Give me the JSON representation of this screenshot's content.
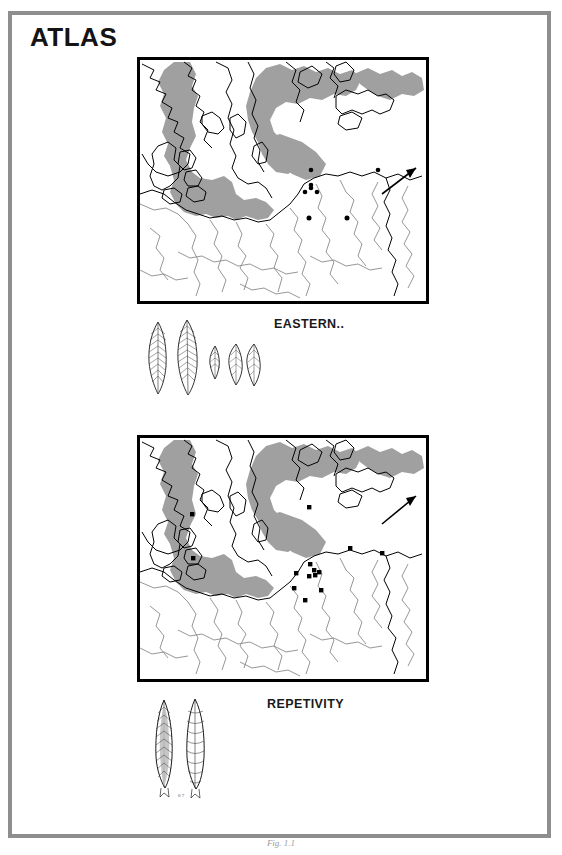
{
  "page": {
    "title": "ATLAS",
    "caption": "Fig. 1.1",
    "frame_color": "#8e8e8e",
    "background": "#ffffff"
  },
  "colors": {
    "sea_fill": "#a0a0a0",
    "land_fill": "#ffffff",
    "coastline": "#000000",
    "river": "#8a8a8a",
    "site_dot": "#000000",
    "map_border": "#000000",
    "text": "#1a1a1a"
  },
  "figures": [
    {
      "id": "figure-upper",
      "label": "EASTERN..",
      "map": {
        "name": "baltic-region-distribution-map-1",
        "region": "Baltic Sea and Northern Europe",
        "north_arrow": true,
        "site_count": 7,
        "sites": [
          {
            "x": 0.597,
            "y": 0.457
          },
          {
            "x": 0.597,
            "y": 0.52
          },
          {
            "x": 0.575,
            "y": 0.546
          },
          {
            "x": 0.618,
            "y": 0.546
          },
          {
            "x": 0.596,
            "y": 0.53
          },
          {
            "x": 0.592,
            "y": 0.655
          },
          {
            "x": 0.723,
            "y": 0.655
          },
          {
            "x": 0.83,
            "y": 0.455
          }
        ]
      },
      "artifacts": {
        "name": "lithic-points-plate-upper",
        "count": 5,
        "description": "Flint blade points, retouched bifacial leaf shapes"
      }
    },
    {
      "id": "figure-lower",
      "label": "REPETIVITY",
      "map": {
        "name": "baltic-region-distribution-map-2",
        "region": "Baltic Sea and Northern Europe",
        "north_arrow": true,
        "site_count": 14,
        "sites": [
          {
            "x": 0.592,
            "y": 0.288
          },
          {
            "x": 0.182,
            "y": 0.318
          },
          {
            "x": 0.185,
            "y": 0.498
          },
          {
            "x": 0.735,
            "y": 0.455
          },
          {
            "x": 0.845,
            "y": 0.478
          },
          {
            "x": 0.596,
            "y": 0.52
          },
          {
            "x": 0.607,
            "y": 0.538
          },
          {
            "x": 0.622,
            "y": 0.545
          },
          {
            "x": 0.61,
            "y": 0.557
          },
          {
            "x": 0.59,
            "y": 0.56
          },
          {
            "x": 0.548,
            "y": 0.553
          },
          {
            "x": 0.54,
            "y": 0.617
          },
          {
            "x": 0.632,
            "y": 0.622
          },
          {
            "x": 0.578,
            "y": 0.662
          }
        ]
      },
      "artifacts": {
        "name": "lithic-points-plate-lower",
        "count": 2,
        "scale_label": "0 7",
        "description": "Two elongated flint points with tangs"
      }
    }
  ]
}
